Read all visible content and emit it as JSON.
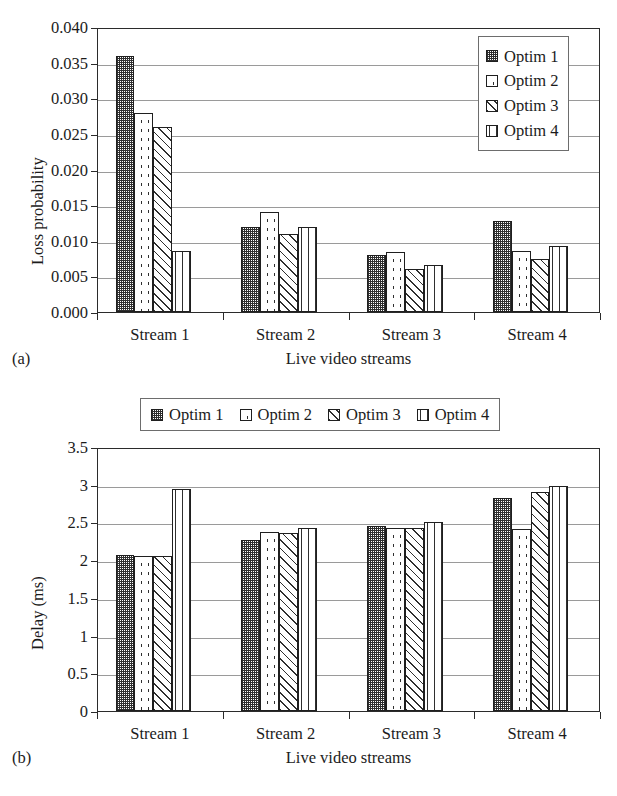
{
  "figure": {
    "panels": [
      {
        "tag": "(a)",
        "xlabel": "Live video streams",
        "ylabel": "Loss probability",
        "legend_orientation": "vertical"
      },
      {
        "tag": "(b)",
        "xlabel": "Live video streams",
        "ylabel": "Delay (ms)",
        "legend_orientation": "horizontal"
      }
    ]
  },
  "chart_data": [
    {
      "type": "bar",
      "title": "",
      "xlabel": "Live video streams",
      "ylabel": "Loss probability",
      "categories": [
        "Stream 1",
        "Stream 2",
        "Stream 3",
        "Stream 4"
      ],
      "series": [
        {
          "name": "Optim 1",
          "values": [
            0.036,
            0.012,
            0.008,
            0.0128
          ]
        },
        {
          "name": "Optim 2",
          "values": [
            0.028,
            0.014,
            0.0084,
            0.0085
          ]
        },
        {
          "name": "Optim 3",
          "values": [
            0.026,
            0.011,
            0.006,
            0.0075
          ]
        },
        {
          "name": "Optim 4",
          "values": [
            0.0085,
            0.012,
            0.0066,
            0.0093
          ]
        }
      ],
      "ylim": [
        0.0,
        0.04
      ],
      "yticks": [
        "0.000",
        "0.005",
        "0.010",
        "0.015",
        "0.020",
        "0.025",
        "0.030",
        "0.035",
        "0.040"
      ],
      "ytick_values": [
        0.0,
        0.005,
        0.01,
        0.015,
        0.02,
        0.025,
        0.03,
        0.035,
        0.04
      ],
      "grid": true,
      "legend_position": "top-right",
      "panel": "(a)"
    },
    {
      "type": "bar",
      "title": "",
      "xlabel": "Live video streams",
      "ylabel": "Delay (ms)",
      "categories": [
        "Stream 1",
        "Stream 2",
        "Stream 3",
        "Stream 4"
      ],
      "series": [
        {
          "name": "Optim 1",
          "values": [
            2.07,
            2.27,
            2.45,
            2.82
          ]
        },
        {
          "name": "Optim 2",
          "values": [
            2.05,
            2.37,
            2.43,
            2.41
          ]
        },
        {
          "name": "Optim 3",
          "values": [
            2.06,
            2.36,
            2.43,
            2.9
          ]
        },
        {
          "name": "Optim 4",
          "values": [
            2.95,
            2.43,
            2.51,
            2.98
          ]
        }
      ],
      "ylim": [
        0,
        3.5
      ],
      "yticks": [
        "0",
        "0.5",
        "1",
        "1.5",
        "2",
        "2.5",
        "3",
        "3.5"
      ],
      "ytick_values": [
        0,
        0.5,
        1,
        1.5,
        2,
        2.5,
        3,
        3.5
      ],
      "grid": true,
      "legend_position": "above",
      "panel": "(b)"
    }
  ],
  "series_patterns": [
    "p1",
    "p2",
    "p3",
    "p4"
  ]
}
